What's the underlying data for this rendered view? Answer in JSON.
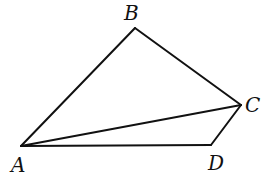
{
  "diagram": {
    "type": "quadrilateral-with-diagonal",
    "stroke_color": "#111111",
    "background": "#ffffff",
    "points": {
      "A": {
        "label": "A",
        "x": 21,
        "y": 146,
        "label_x": 11,
        "label_y": 172
      },
      "B": {
        "label": "B",
        "x": 135,
        "y": 28,
        "label_x": 124,
        "label_y": 20
      },
      "C": {
        "label": "C",
        "x": 241,
        "y": 105,
        "label_x": 245,
        "label_y": 112
      },
      "D": {
        "label": "D",
        "x": 211,
        "y": 145,
        "label_x": 208,
        "label_y": 170
      }
    },
    "segments": [
      {
        "name": "AB",
        "from": "A",
        "to": "B"
      },
      {
        "name": "BC",
        "from": "B",
        "to": "C"
      },
      {
        "name": "CD",
        "from": "C",
        "to": "D"
      },
      {
        "name": "DA",
        "from": "D",
        "to": "A"
      },
      {
        "name": "AC",
        "from": "A",
        "to": "C"
      }
    ]
  }
}
